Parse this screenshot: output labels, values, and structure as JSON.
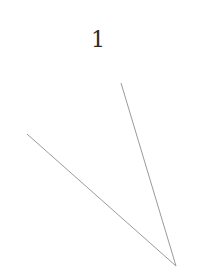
{
  "diagram": {
    "label": "1",
    "stroke_color": "#9a9a9a",
    "vertex": {
      "x": 176,
      "y": 266
    },
    "ray_a_end": {
      "x": 121,
      "y": 83
    },
    "ray_b_end": {
      "x": 27,
      "y": 134
    }
  }
}
